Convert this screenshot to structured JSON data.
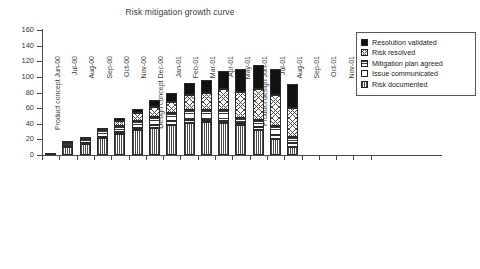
{
  "chart_data": {
    "type": "bar",
    "title": "Risk mitigation growth curve",
    "xlabel": "",
    "ylabel": "",
    "ylim": [
      0,
      160
    ],
    "yticks": [
      0,
      20,
      40,
      60,
      80,
      100,
      120,
      140,
      160
    ],
    "grid": false,
    "stacked": true,
    "legend_position": "top-right",
    "categories": [
      "Product concept Jun-00",
      "Jul-00",
      "Aug-00",
      "Sep-00",
      "Oct-00",
      "Nov-00",
      "Design concept Dec-00",
      "Jan-01",
      "Feb-01",
      "Mar-01",
      "Apr-01",
      "May-01",
      "Product design Jun-01",
      "Jul-01",
      "Aug-01",
      "Sep-01",
      "Oct-01",
      "Nov-01",
      "Dec-01"
    ],
    "series": [
      {
        "name": "Risk documented",
        "pattern": "vertical-lines",
        "values": [
          3,
          10,
          14,
          22,
          27,
          32,
          35,
          39,
          41,
          42,
          41,
          38,
          32,
          21,
          10,
          0,
          0,
          0,
          0
        ]
      },
      {
        "name": "Issue communicated",
        "pattern": "white",
        "values": [
          0,
          2,
          1,
          1,
          3,
          3,
          4,
          4,
          4,
          3,
          3,
          3,
          4,
          5,
          5,
          0,
          0,
          0,
          0
        ]
      },
      {
        "name": "Mitigation plan agreed",
        "pattern": "horizontal-lines",
        "values": [
          0,
          3,
          5,
          9,
          7,
          8,
          10,
          11,
          12,
          13,
          14,
          7,
          9,
          11,
          8,
          0,
          0,
          0,
          0
        ]
      },
      {
        "name": "Risk resolved",
        "pattern": "diagonal-crosshatch",
        "values": [
          0,
          1,
          2,
          3,
          6,
          11,
          12,
          14,
          20,
          21,
          27,
          33,
          39,
          40,
          37,
          0,
          0,
          0,
          0
        ]
      },
      {
        "name": "Resolution validated",
        "pattern": "solid-black",
        "values": [
          0,
          0,
          0,
          0,
          4,
          5,
          9,
          11,
          15,
          17,
          22,
          29,
          31,
          33,
          31,
          0,
          0,
          0,
          0
        ]
      }
    ],
    "totals": [
      3,
      16,
      22,
      35,
      47,
      59,
      70,
      79,
      92,
      96,
      107,
      110,
      115,
      110,
      91,
      0,
      0,
      0,
      0
    ],
    "legend_entries": [
      {
        "label": "Resolution validated",
        "pattern": "solid-black"
      },
      {
        "label": "Risk resolved",
        "pattern": "diagonal-crosshatch"
      },
      {
        "label": "Mitigation plan agreed",
        "pattern": "horizontal-lines"
      },
      {
        "label": "Issue communicated",
        "pattern": "white"
      },
      {
        "label": "Risk documented",
        "pattern": "vertical-lines"
      }
    ]
  }
}
